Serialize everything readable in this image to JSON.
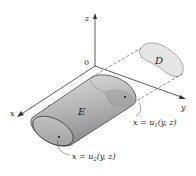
{
  "figure": {
    "axes": {
      "x_label": "x",
      "y_label": "y",
      "z_label": "z",
      "origin_label": "0"
    },
    "region_label": "E",
    "projection_label": "D",
    "surfaces": {
      "back_surface": {
        "lhs": "x = u",
        "sub": "1",
        "args": "(y, z)"
      },
      "front_surface": {
        "lhs": "x = u",
        "sub": "2",
        "args": "(y, z)"
      }
    },
    "colors": {
      "solid_dark": "#8f8f8f",
      "solid_light": "#d9d9d9",
      "projection_fill": "#e6e6e6",
      "stroke": "#333333"
    }
  }
}
